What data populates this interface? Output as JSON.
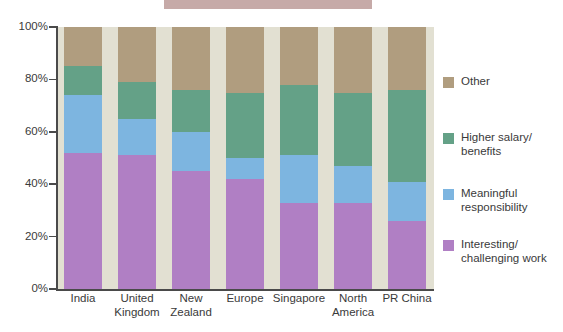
{
  "chart_data": {
    "type": "bar",
    "subtype": "stacked-bar-100",
    "title": "",
    "xlabel": "",
    "ylabel": "",
    "ylim": [
      0,
      100
    ],
    "ytick_labels": [
      "100%",
      "80%",
      "60%",
      "40%",
      "20%",
      "0%"
    ],
    "ytick_values": [
      100,
      80,
      60,
      40,
      20,
      0
    ],
    "grid": false,
    "legend_position": "right",
    "categories": [
      "India",
      "United\nKingdom",
      "New\nZealand",
      "Europe",
      "Singapore",
      "North\nAmerica",
      "PR China"
    ],
    "category_labels_flat": [
      "India",
      "United Kingdom",
      "New Zealand",
      "Europe",
      "Singapore",
      "North America",
      "PR China"
    ],
    "series": [
      {
        "name": "Interesting/\nchallenging work",
        "color": "#b07fc4",
        "values": [
          52,
          51,
          45,
          42,
          33,
          33,
          26
        ]
      },
      {
        "name": "Meaningful\nresponsibility",
        "color": "#7db5e0",
        "values": [
          22,
          14,
          15,
          8,
          18,
          14,
          15
        ]
      },
      {
        "name": "Higher salary/\nbenefits",
        "color": "#64a187",
        "values": [
          11,
          14,
          16,
          25,
          27,
          28,
          35
        ]
      },
      {
        "name": "Other",
        "color": "#b09d7f",
        "values": [
          15,
          21,
          24,
          25,
          22,
          25,
          24
        ]
      }
    ],
    "legend_entries": [
      {
        "label": "Other",
        "color": "#b09d7f"
      },
      {
        "label": "Higher salary/\nbenefits",
        "color": "#64a187"
      },
      {
        "label": "Meaningful\nresponsibility",
        "color": "#7db5e0"
      },
      {
        "label": "Interesting/\nchallenging work",
        "color": "#b07fc4"
      }
    ],
    "plot_background_color": "#e2e0d2",
    "axis_color": "#4a4a4a",
    "page_background_color": "#ffffff",
    "top_band_color": "#c6aaa8"
  }
}
